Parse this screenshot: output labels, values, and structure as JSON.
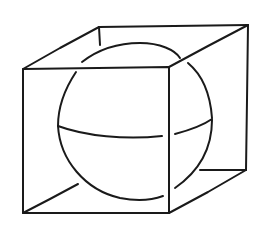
{
  "figure": {
    "description": "Hand-drawn line sketch of a sphere inscribed in a cube, with the sphere's equator drawn and hidden lines interrupted where they pass behind edges",
    "elements": [
      "cube",
      "sphere",
      "equator"
    ],
    "colors": {
      "background": "#ffffff",
      "ink": "#1a1a1a"
    }
  },
  "cube": {
    "front_face": {
      "top_left": [
        23,
        69
      ],
      "top_right": [
        169,
        67
      ],
      "bottom_right": [
        169,
        213
      ],
      "bottom_left": [
        23,
        213
      ]
    },
    "back_face": {
      "top_left": [
        99,
        27
      ],
      "top_right": [
        248,
        25
      ],
      "bottom_right": [
        246,
        170
      ],
      "bottom_left_hidden": true
    }
  },
  "sphere": {
    "center": [
      136,
      134
    ],
    "radius_x": 78,
    "radius_y": 90
  }
}
